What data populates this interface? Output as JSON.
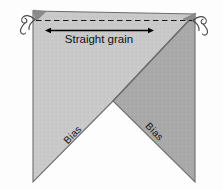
{
  "diagram": {
    "background_color": "#fdfdfd",
    "labels": {
      "straight_grain": "Straight grain",
      "bias_left": "Bias",
      "bias_right": "Bias"
    },
    "regions": [
      {
        "name": "left-triangle-panel",
        "fill": "#c9c9c9",
        "stroke": "#6e6e6e"
      },
      {
        "name": "right-triangle-panel",
        "fill": "#a9a9a9",
        "stroke": "#6e6e6e"
      },
      {
        "name": "top-left-corner-shadow",
        "fill": "#8a8a8a"
      },
      {
        "name": "top-right-corner-shadow",
        "fill": "#8a8a8a"
      }
    ],
    "guides": [
      {
        "name": "straight-grain-dashed-line",
        "style": "dashed",
        "color": "#1a1a1a"
      },
      {
        "name": "straight-grain-double-arrow",
        "style": "double-headed",
        "color": "#000000"
      }
    ],
    "ornaments": [
      {
        "name": "thread-curl-left",
        "color": "#4a4a4a"
      },
      {
        "name": "thread-curl-right",
        "color": "#4a4a4a"
      }
    ],
    "geometry": {
      "top_left": [
        33,
        11
      ],
      "top_right": [
        195,
        14
      ],
      "notch_apex": [
        113,
        101
      ],
      "bottom_left": [
        33,
        182
      ],
      "bottom_right": [
        195,
        182
      ]
    },
    "colors": {
      "light_panel": "#c9c9c9",
      "dark_panel": "#a9a9a9",
      "outline": "#6e6e6e",
      "ink": "#111111",
      "shadow": "#8a8a8a"
    }
  }
}
